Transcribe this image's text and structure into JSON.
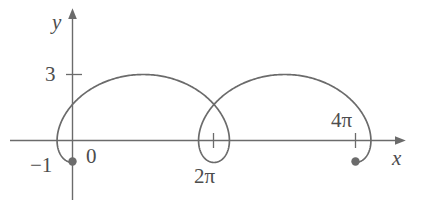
{
  "figure": {
    "background_color": "#ffffff",
    "curve_color": "#6b6b6b",
    "axis_color": "#6b6b6b",
    "label_color": "#4d4d4d",
    "width": 428,
    "height": 210
  },
  "axes": {
    "x_axis_label": "x",
    "y_axis_label": "y",
    "x_tick_labels": [
      "0",
      "2π",
      "4π"
    ],
    "y_tick_labels": [
      "3",
      "-1"
    ]
  },
  "labels": {
    "y": "y",
    "x": "x",
    "three": "3",
    "zero": "0",
    "neg_one": "−1",
    "two_pi": "2π",
    "four_pi": "4π"
  },
  "chart_data": {
    "type": "line",
    "title": "",
    "xlabel": "x",
    "ylabel": "y",
    "grid": false,
    "legend": null,
    "curve_name": "prolate cycloid (trochoid)",
    "parametric": {
      "x_expression": "t - 2*sin(t)",
      "y_expression": "1 - 2*cos(t)",
      "t_range": [
        0,
        12.566370614359172
      ],
      "t_label": "θ"
    },
    "xlim": [
      -1.5,
      13.8
    ],
    "ylim": [
      -1.6,
      3.9
    ],
    "x_ticks": [
      0,
      6.283185307179586,
      12.566370614359172
    ],
    "x_tick_labels": [
      "0",
      "2π",
      "4π"
    ],
    "y_ticks": [
      3,
      -1
    ],
    "y_tick_labels": [
      "3",
      "-1"
    ],
    "annotations": [
      {
        "label": "start point",
        "x": 0,
        "y": -1,
        "marker": "filled-circle"
      },
      {
        "label": "end point",
        "x": 12.566370614359172,
        "y": -1,
        "marker": "filled-circle"
      }
    ],
    "features": [
      {
        "label": "first arch maximum",
        "x": 3.141592653589793,
        "y": 3
      },
      {
        "label": "second arch maximum",
        "x": 9.42477796076938,
        "y": 3
      },
      {
        "label": "self-intersection loop center",
        "x": 6.283185307179586,
        "y": 0
      }
    ],
    "x": [
      0.0,
      0.3141592653589793,
      0.6283185307179586,
      0.9424777960769379,
      1.2566370614359172,
      1.5707963267948966,
      1.8849555921538759,
      2.199114857512855,
      2.5132741228718345,
      2.827433388230814,
      3.141592653589793,
      3.4557519189487724,
      3.7699111843077517,
      4.084070449666731,
      4.39822971502571,
      4.71238898038469,
      5.026548245743669,
      5.340707511102648,
      5.654866776461628,
      5.969026041820607,
      6.283185307179586,
      6.5973445725385655,
      6.911503837897545,
      7.225663103256524,
      7.5398223686155035,
      7.853981633974483,
      8.168140899333462,
      8.482300164692441,
      8.79645943005142,
      9.1106186954104,
      9.42477796076938,
      9.738937226128359,
      10.053096491487338,
      10.367255756846317,
      10.681415022205297,
      10.995574287564276,
      11.309733552923255,
      11.623892818282235,
      11.938052083641214,
      12.252211349000193,
      12.566370614359172
    ],
    "y": [
      -1.0,
      -0.90211303259031,
      -0.61803398874989,
      -0.17557050458495,
      0.38196601125011,
      1.0,
      1.61803398874989,
      2.17557050458495,
      2.61803398874989,
      2.90211303259031,
      3.0,
      2.90211303259031,
      2.61803398874989,
      2.17557050458495,
      1.61803398874989,
      1.0,
      0.38196601125011,
      -0.17557050458495,
      -0.61803398874989,
      -0.90211303259031,
      -1.0,
      -0.90211303259031,
      -0.61803398874989,
      -0.17557050458495,
      0.38196601125011,
      1.0,
      1.61803398874989,
      2.17557050458495,
      2.61803398874989,
      2.90211303259031,
      3.0,
      2.90211303259031,
      2.61803398874989,
      2.17557050458495,
      1.61803398874989,
      1.0,
      0.38196601125011,
      -0.17557050458495,
      -0.61803398874989,
      -0.90211303259031,
      -1.0
    ]
  }
}
